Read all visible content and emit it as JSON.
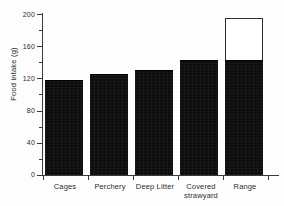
{
  "chart_data": {
    "type": "bar",
    "title": "",
    "subtitle": "",
    "xlabel": "",
    "ylabel": "Food intake (g)",
    "ylim": [
      0,
      200
    ],
    "y_major_ticks": [
      0,
      40,
      80,
      120,
      160,
      200
    ],
    "y_minor_ticks": [
      20,
      60,
      100,
      140,
      180
    ],
    "grid": false,
    "legend": null,
    "categories": [
      "Cages",
      "Perchery",
      "Deep Litter",
      "Covered strawyard",
      "Range"
    ],
    "series": [
      {
        "name": "Food intake",
        "style": "filled",
        "values": [
          118,
          125,
          130,
          143,
          143
        ]
      },
      {
        "name": "Additional range intake",
        "style": "open",
        "values": [
          null,
          null,
          null,
          null,
          195
        ]
      }
    ]
  },
  "axis": {
    "y_tick_labels": [
      "200",
      "160",
      "120",
      "80",
      "40",
      "0"
    ],
    "y_title": "Food intake (g)"
  },
  "categories_display": [
    {
      "line1": "Cages",
      "line2": ""
    },
    {
      "line1": "Perchery",
      "line2": ""
    },
    {
      "line1": "Deep Litter",
      "line2": ""
    },
    {
      "line1": "Covered",
      "line2": "strawyard"
    },
    {
      "line1": "Range",
      "line2": ""
    }
  ],
  "colors": {
    "bar_fill": "#0d0d0d",
    "bar_open_fill": "#ffffff",
    "bar_open_stroke": "#2e2e2e",
    "axis": "#3a3a3a",
    "text": "#2b2b2b",
    "background": "#fdfdfd"
  }
}
